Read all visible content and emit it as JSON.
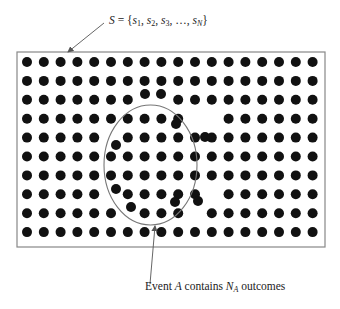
{
  "diagram": {
    "set_label": {
      "lhs": "S",
      "equals": " = {",
      "elements": [
        {
          "name": "s",
          "sub": "1"
        },
        {
          "name": "s",
          "sub": "2"
        },
        {
          "name": "s",
          "sub": "3"
        },
        {
          "name": "…",
          "sub": ""
        },
        {
          "name": "s",
          "sub": "N"
        }
      ],
      "close": "}",
      "text": "S = {s1, s2, s3, ..., sN}"
    },
    "event_label": {
      "prefix": "Event ",
      "event": "A",
      "middle": " contains ",
      "count": "N",
      "count_sub": "A",
      "suffix": " outcomes",
      "text": "Event A contains N_A outcomes"
    },
    "colors": {
      "dot": "#111111",
      "border": "#888888",
      "ellipse": "#777777",
      "arrow": "#555555",
      "text": "#222222"
    },
    "box": {
      "x": 17,
      "y": 52,
      "width": 308,
      "height": 195
    },
    "ellipse": {
      "cx": 150.5,
      "cy": 165,
      "rx": 46.5,
      "ry": 60
    },
    "grid": {
      "cols": 18,
      "rows": 10,
      "x0": 27,
      "dx": 16.8,
      "y0": 62,
      "dy": 18.9,
      "dot_radius": 5
    },
    "displaced_dots": [
      {
        "col": 7,
        "row": 2,
        "x": 145,
        "y": 94
      },
      {
        "col": 8,
        "row": 2,
        "x": 161,
        "y": 94
      },
      {
        "col": 10,
        "row": 3,
        "x": 176,
        "y": 124
      },
      {
        "col": 11,
        "row": 3,
        "x": 205,
        "y": 137
      },
      {
        "col": 5,
        "row": 4,
        "x": 116,
        "y": 145
      },
      {
        "col": 5,
        "row": 7,
        "x": 116,
        "y": 189
      },
      {
        "col": 11,
        "row": 7,
        "x": 198,
        "y": 201
      },
      {
        "col": 6,
        "row": 8,
        "x": 131,
        "y": 207
      },
      {
        "col": 10,
        "row": 8,
        "x": 175,
        "y": 202
      }
    ],
    "arrows": {
      "set_pointer": {
        "x1": 104,
        "y1": 23,
        "x2": 68,
        "y2": 52
      },
      "event_pointer": {
        "x1": 150,
        "y1": 284,
        "x2": 155,
        "y2": 226
      }
    }
  }
}
